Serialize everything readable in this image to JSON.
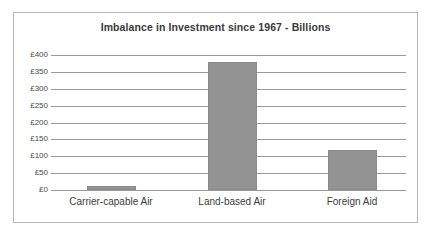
{
  "chart_data": {
    "type": "bar",
    "title": "Imbalance in Investment since 1967 - Billions",
    "xlabel": "",
    "ylabel": "",
    "categories": [
      "Carrier-capable Air",
      "Land-based Air",
      "Foreign Aid"
    ],
    "values": [
      13,
      380,
      119
    ],
    "ylim": [
      0,
      400
    ],
    "yticks": [
      0,
      50,
      100,
      150,
      200,
      250,
      300,
      350,
      400
    ],
    "ytick_labels": [
      "£0",
      "£50",
      "£100",
      "£150",
      "£200",
      "£250",
      "£300",
      "£350",
      "£400"
    ],
    "grid": true,
    "legend": false,
    "legend_position": "none",
    "series": [
      {
        "name": "Investment",
        "values": [
          13,
          380,
          119
        ],
        "color": "#939393"
      }
    ],
    "colors": {
      "bar_fill": "#939393",
      "bar_border": "#8a8a8a",
      "gridline": "#9a9a9a",
      "frame_border": "#b8b8b8",
      "title_text": "#3a3a3a",
      "tick_text": "#4a4a4a",
      "category_text": "#3d3d3d",
      "background": "#ffffff"
    }
  }
}
